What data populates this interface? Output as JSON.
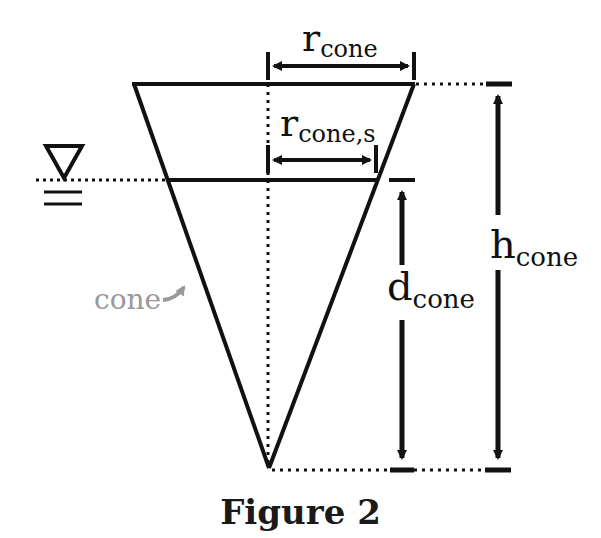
{
  "figure": {
    "caption": "Figure 2",
    "labels": {
      "r_cone": {
        "main": "r",
        "sub": "cone"
      },
      "r_cone_s": {
        "main": "r",
        "sub": "cone,s"
      },
      "d_cone": {
        "main": "d",
        "sub": "cone"
      },
      "h_cone": {
        "main": "h",
        "sub": "cone"
      },
      "cone_pointer": "cone"
    },
    "symbols": {
      "water_surface": "water-level-triangle"
    },
    "colors": {
      "line": "#111111",
      "pointer_label": "#999999",
      "background": "#ffffff"
    }
  }
}
